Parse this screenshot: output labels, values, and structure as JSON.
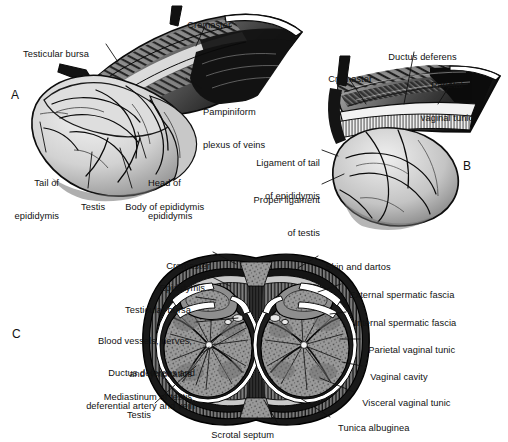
{
  "figure": {
    "type": "anatomical-illustration",
    "background": "#ffffff",
    "ink": "#111111"
  },
  "panels": [
    {
      "id": "A",
      "letter": "A",
      "letter_pos": [
        14,
        95
      ],
      "caption": "Lateral view of testis, epididymis and spermatic cord with tunics reflected",
      "labels": [
        {
          "name": "cremaster",
          "text": "Cremaster",
          "x": 182,
          "y": 9,
          "align": "left",
          "lines": [
            "Cremaster"
          ]
        },
        {
          "name": "testicular-bursa",
          "text": "Testicular bursa",
          "x": 18,
          "y": 38,
          "align": "left",
          "lines": [
            "Testicular bursa"
          ]
        },
        {
          "name": "pampiniform-plexus",
          "text": "Pampiniform plexus of veins",
          "x": 203,
          "y": 84,
          "align": "left",
          "lines": [
            "Pampiniform",
            "plexus of veins"
          ]
        },
        {
          "name": "tail-of-epididymis",
          "text": "Tail of epididymis",
          "x": 58,
          "y": 155,
          "align": "right",
          "lines": [
            "Tail of",
            "epididymis"
          ]
        },
        {
          "name": "head-of-epididymis",
          "text": "Head of epididymis",
          "x": 148,
          "y": 155,
          "align": "left",
          "lines": [
            "Head of",
            "epididymis"
          ]
        },
        {
          "name": "testis",
          "text": "Testis",
          "x": 76,
          "y": 191,
          "align": "left",
          "lines": [
            "Testis"
          ]
        },
        {
          "name": "body-of-epididymis",
          "text": "Body of epididymis",
          "x": 120,
          "y": 191,
          "align": "left",
          "lines": [
            "Body of epididymis"
          ]
        }
      ]
    },
    {
      "id": "B",
      "letter": "B",
      "letter_pos": [
        466,
        159
      ],
      "caption": "Medial view showing ductus deferens, parietal vaginal tunic and ligaments",
      "labels": [
        {
          "name": "ductus-deferens",
          "text": "Ductus deferens",
          "x": 383,
          "y": 41,
          "align": "left",
          "lines": [
            "Ductus deferens"
          ]
        },
        {
          "name": "cremaster",
          "text": "Cremaster",
          "x": 323,
          "y": 63,
          "align": "left",
          "lines": [
            "Cremaster"
          ]
        },
        {
          "name": "parietal-vaginal-tunic",
          "text": "Parietal vaginal tunic",
          "x": 447,
          "y": 57,
          "align": "center",
          "lines": [
            "Parietal",
            "vaginal tunic"
          ]
        },
        {
          "name": "ligament-of-tail",
          "text": "Ligament of tail of epididymis",
          "x": 320,
          "y": 135,
          "align": "right",
          "lines": [
            "Ligament of tail",
            "of epididymis"
          ]
        },
        {
          "name": "proper-ligament-of-testis",
          "text": "Proper ligament of testis",
          "x": 320,
          "y": 172,
          "align": "right",
          "lines": [
            "Proper ligament",
            "of testis"
          ]
        }
      ]
    },
    {
      "id": "C",
      "letter": "C",
      "letter_pos": [
        16,
        327
      ],
      "caption": "Transverse section of the scrotum showing both testes and their coverings",
      "labels_left": [
        {
          "name": "cremaster",
          "text": "Cremaster",
          "x": 160,
          "y": 250,
          "lines": [
            "Cremaster"
          ]
        },
        {
          "name": "epididymis",
          "text": "Epididymis",
          "x": 155,
          "y": 272,
          "lines": [
            "Epididymis"
          ]
        },
        {
          "name": "testicular-bursa",
          "text": "Testicular bursa",
          "x": 141,
          "y": 294,
          "lines": [
            "Testicular bursa"
          ]
        },
        {
          "name": "blood-vessels-nerves-lymphatics",
          "text": "Blood vessels, nerves, and lymphatics",
          "x": 137,
          "y": 313,
          "lines": [
            "Blood vessels, nerves,",
            "and lymphatics"
          ]
        },
        {
          "name": "ductus-deferens-deferential-vessels",
          "text": "Ductus deferens and deferential artery and vein",
          "x": 139,
          "y": 345,
          "lines": [
            "Ductus deferens and",
            "deferential artery and vein"
          ]
        },
        {
          "name": "mediastinum-of-testis",
          "text": "Mediastinum of testis",
          "x": 142,
          "y": 382,
          "lines": [
            "Mediastinum of testis"
          ]
        },
        {
          "name": "testis",
          "text": "Testis",
          "x": 118,
          "y": 400,
          "lines": [
            "Testis"
          ]
        },
        {
          "name": "scrotal-septum",
          "text": "Scrotal septum",
          "x": 214,
          "y": 421,
          "lines": [
            "Scrotal septum"
          ]
        }
      ],
      "labels_right": [
        {
          "name": "skin-and-dartos",
          "text": "Skin and dartos",
          "x": 320,
          "y": 253,
          "lines": [
            "Skin and dartos"
          ]
        },
        {
          "name": "external-spermatic-fascia",
          "text": "External spermatic fascia",
          "x": 343,
          "y": 281,
          "lines": [
            "External spermatic fascia"
          ]
        },
        {
          "name": "internal-spermatic-fascia",
          "text": "Internal spermatic fascia",
          "x": 348,
          "y": 309,
          "lines": [
            "Internal spermatic fascia"
          ]
        },
        {
          "name": "parietal-vaginal-tunic",
          "text": "Parietal vaginal tunic",
          "x": 362,
          "y": 336,
          "lines": [
            "Parietal vaginal tunic"
          ]
        },
        {
          "name": "vaginal-cavity",
          "text": "Vaginal cavity",
          "x": 364,
          "y": 363,
          "lines": [
            "Vaginal cavity"
          ]
        },
        {
          "name": "visceral-vaginal-tunic",
          "text": "Visceral vaginal tunic",
          "x": 356,
          "y": 389,
          "lines": [
            "Visceral vaginal tunic"
          ]
        },
        {
          "name": "tunica-albuginea",
          "text": "Tunica albuginea",
          "x": 332,
          "y": 414,
          "lines": [
            "Tunica albuginea"
          ]
        }
      ]
    }
  ]
}
